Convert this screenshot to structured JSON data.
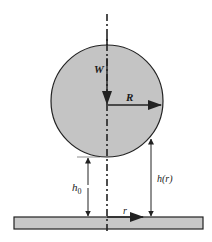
{
  "diagram": {
    "title": "",
    "labels": {
      "weight": "W",
      "sphere_radius": "R",
      "min_gap": "h",
      "min_gap_subscript": "0",
      "gap_function": "h(r)",
      "radial_coord": "r"
    },
    "colors": {
      "sphere_fill": "#c4c4c4",
      "plate_fill": "#c8c8c8",
      "stroke": "#222222",
      "background": "#ffffff"
    },
    "elements": [
      "sphere",
      "plate",
      "symmetry-axis",
      "weight-arrow",
      "radius-arrow",
      "min-gap-dimension",
      "gap-function-dimension",
      "radial-coordinate-arrow"
    ]
  }
}
